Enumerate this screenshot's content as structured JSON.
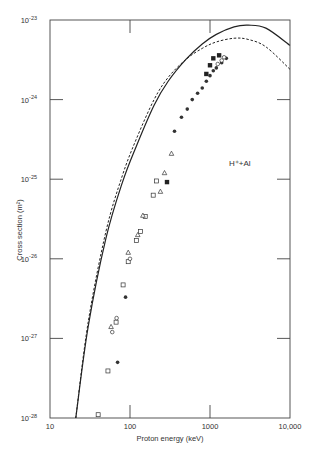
{
  "chart_data": {
    "type": "line",
    "title": "",
    "annotation": "H⁺+Al",
    "xlabel": "Proton energy (keV)",
    "ylabel": "Cross section (m²)",
    "xscale": "log",
    "yscale": "log",
    "xlim": [
      10,
      10000
    ],
    "ylim": [
      1e-28,
      1e-23
    ],
    "x_ticks": [
      {
        "value": 10,
        "label": "10"
      },
      {
        "value": 100,
        "label": "100"
      },
      {
        "value": 1000,
        "label": "1000"
      },
      {
        "value": 10000,
        "label": "10,000"
      }
    ],
    "y_ticks": [
      {
        "value": -23,
        "label": "10",
        "exp": "-23"
      },
      {
        "value": -24,
        "label": "10",
        "exp": "-24"
      },
      {
        "value": -25,
        "label": "10",
        "exp": "-25"
      },
      {
        "value": -26,
        "label": "10",
        "exp": "-26"
      },
      {
        "value": -27,
        "label": "10",
        "exp": "-27"
      },
      {
        "value": -28,
        "label": "10",
        "exp": "-28"
      }
    ],
    "grid": false,
    "series": [
      {
        "name": "theory-solid",
        "style": "solid",
        "x": [
          21,
          30,
          50,
          80,
          120,
          200,
          300,
          500,
          800,
          1200,
          2000,
          3000,
          5000,
          10000
        ],
        "y": [
          1e-28,
          1.4e-27,
          1.8e-26,
          9e-26,
          2.6e-25,
          8.5e-25,
          1.7e-24,
          3.2e-24,
          5e-24,
          6.6e-24,
          8.2e-24,
          8.6e-24,
          7.9e-24,
          4.8e-24
        ]
      },
      {
        "name": "theory-dashed",
        "style": "dashed",
        "x": [
          21,
          30,
          50,
          80,
          120,
          200,
          300,
          500,
          800,
          1200,
          2000,
          3000,
          5000,
          10000
        ],
        "y": [
          1e-28,
          1.6e-27,
          2.2e-26,
          1.1e-25,
          3.2e-25,
          1e-24,
          1.9e-24,
          3.2e-24,
          4.4e-24,
          5.3e-24,
          5.9e-24,
          5.7e-24,
          4.6e-24,
          2.4e-24
        ]
      },
      {
        "name": "filled-squares",
        "marker": "filled-square",
        "x": [
          290,
          900,
          1000,
          1100,
          1300
        ],
        "y": [
          9.2e-26,
          2.1e-24,
          2.7e-24,
          3.3e-24,
          3.6e-24
        ]
      },
      {
        "name": "filled-circles",
        "marker": "filled-circle",
        "x": [
          70,
          88,
          360,
          440,
          520,
          600,
          700,
          800,
          900,
          1000,
          1100,
          1200,
          1400,
          1600
        ],
        "y": [
          5e-28,
          3.3e-27,
          4e-25,
          6e-25,
          7.6e-25,
          1e-24,
          1.2e-24,
          1.4e-24,
          1.7e-24,
          2e-24,
          2.3e-24,
          2.5e-24,
          2.9e-24,
          3.3e-24
        ]
      },
      {
        "name": "open-squares",
        "marker": "open-square",
        "x": [
          40,
          53,
          67,
          82,
          95,
          120,
          135,
          155,
          195,
          215
        ],
        "y": [
          1.1e-28,
          3.9e-28,
          1.6e-27,
          4.7e-27,
          9.2e-27,
          1.7e-26,
          2.2e-26,
          3.4e-26,
          6.3e-26,
          9.5e-26
        ]
      },
      {
        "name": "open-triangles",
        "marker": "open-triangle",
        "x": [
          58,
          95,
          125,
          145,
          240,
          270,
          330
        ],
        "y": [
          1.4e-27,
          1.2e-26,
          2e-26,
          3.5e-26,
          7e-26,
          1.2e-25,
          2.1e-25
        ]
      },
      {
        "name": "open-circles",
        "marker": "open-circle",
        "x": [
          60,
          68,
          100,
          1250,
          1400,
          1500
        ],
        "y": [
          1.2e-27,
          1.8e-27,
          1e-26,
          2.8e-24,
          3.1e-24,
          3.4e-24
        ]
      }
    ]
  }
}
